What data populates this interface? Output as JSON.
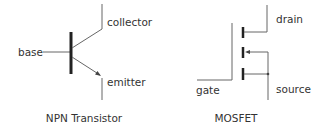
{
  "npn": {
    "title": "NPN Transistor",
    "labels": {
      "base": "base",
      "collector": "collector",
      "emitter": "emitter"
    }
  },
  "mosfet": {
    "title": "MOSFET",
    "labels": {
      "gate": "gate",
      "drain": "drain",
      "source": "source"
    }
  },
  "colors": {
    "line": "#555555",
    "text": "#333333"
  }
}
